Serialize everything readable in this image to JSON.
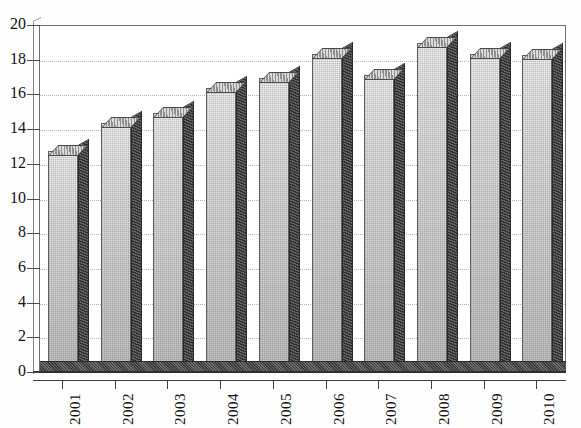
{
  "chart_data": {
    "type": "bar",
    "title": "",
    "subtitle": "",
    "xlabel": "",
    "ylabel": "",
    "categories": [
      "2001",
      "2002",
      "2003",
      "2004",
      "2005",
      "2006",
      "2007",
      "2008",
      "2009",
      "2010"
    ],
    "values": [
      12.8,
      14.4,
      15.0,
      16.4,
      17.0,
      18.4,
      17.2,
      19.0,
      18.4,
      18.3
    ],
    "series": [
      {
        "name": "",
        "values": [
          12.8,
          14.4,
          15.0,
          16.4,
          17.0,
          18.4,
          17.2,
          19.0,
          18.4,
          18.3
        ]
      }
    ],
    "ylim": [
      0,
      20
    ],
    "yticks": [
      0,
      2,
      4,
      6,
      8,
      10,
      12,
      14,
      16,
      18,
      20
    ],
    "ytick_labels": [
      "0",
      "2",
      "4",
      "6",
      "8",
      "10",
      "12",
      "14",
      "16",
      "18",
      "20"
    ],
    "gridlines": true,
    "grid_axis": "y",
    "legend": "none",
    "legend_position": "none",
    "style": "3d-bar",
    "annotations": [],
    "colors": {
      "bar_face_light": "#f2f2f2",
      "bar_face_dark": "#c4c4c4",
      "bar_side": "#3a3a3a",
      "bar_top": "#9a9a9a",
      "axis": "#3f3f3f",
      "gridline": "#b4b4b4",
      "background": "#ffffff",
      "text": "#111111"
    }
  },
  "axes": {
    "y_axis_name": "value-axis",
    "x_axis_name": "year-axis"
  },
  "header": {
    "clipped_top_text": ""
  }
}
